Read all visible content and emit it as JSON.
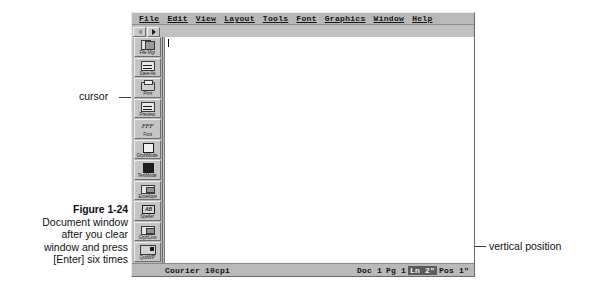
{
  "figure": {
    "number": "Figure 1-24",
    "caption_lines": [
      "Document window",
      "after you clear",
      "window and press",
      "[Enter] six times"
    ]
  },
  "annotations": {
    "cursor": "cursor",
    "vertical_position": "vertical position"
  },
  "window": {
    "menubar": [
      {
        "label": "File",
        "mnemonic": "F"
      },
      {
        "label": "Edit",
        "mnemonic": "E"
      },
      {
        "label": "View",
        "mnemonic": "V"
      },
      {
        "label": "Layout",
        "mnemonic": "L"
      },
      {
        "label": "Tools",
        "mnemonic": "T"
      },
      {
        "label": "Font",
        "mnemonic": "F"
      },
      {
        "label": "Graphics",
        "mnemonic": "G"
      },
      {
        "label": "Window",
        "mnemonic": "W"
      },
      {
        "label": "Help",
        "mnemonic": "H"
      }
    ],
    "nav_buttons": [
      {
        "name": "prev",
        "glyph": "left-triangle"
      },
      {
        "name": "next",
        "glyph": "right-triangle"
      }
    ],
    "buttonbar": [
      {
        "label": "File Mgr",
        "icon": "file-manager-icon"
      },
      {
        "label": "Save As",
        "icon": "save-as-icon"
      },
      {
        "label": "Print",
        "icon": "printer-icon"
      },
      {
        "label": "Preview",
        "icon": "print-preview-icon"
      },
      {
        "label": "Font",
        "icon": "font-icon"
      },
      {
        "label": "GrphMode",
        "icon": "graphics-mode-icon"
      },
      {
        "label": "TextMode",
        "icon": "text-mode-icon"
      },
      {
        "label": "Envelope",
        "icon": "envelope-icon"
      },
      {
        "label": "Speller",
        "icon": "speller-icon"
      },
      {
        "label": "GrphLine",
        "icon": "graphic-line-icon"
      },
      {
        "label": "QuitWP",
        "icon": "quit-icon"
      }
    ],
    "statusbar": {
      "font": "Courier 10cpi",
      "doc": "Doc 1",
      "page": "Pg 1",
      "line": "Ln 2\"",
      "position": "Pos 1\""
    }
  },
  "colors": {
    "window_face": "#c0c0c0",
    "bar_face": "#b9b9b9",
    "canvas": "#ffffff",
    "highlight": "#5b5b5b",
    "ink": "#141414"
  }
}
